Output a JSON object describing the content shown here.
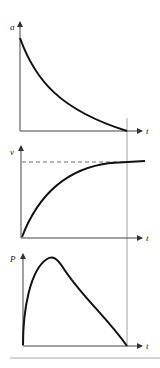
{
  "figure": {
    "panels": [
      {
        "id": "acceleration",
        "ylabel": "a",
        "xlabel": "t",
        "curve": "exponential-decay"
      },
      {
        "id": "velocity",
        "ylabel": "v",
        "xlabel": "t",
        "curve": "exponential-approach",
        "asymptote": "dashed"
      },
      {
        "id": "power",
        "ylabel": "P",
        "xlabel": "t",
        "curve": "rise-peak-decline"
      }
    ],
    "colors": {
      "curve": "#111111",
      "axis": "#444444",
      "guide": "#888888",
      "rule": "#aaaaaa"
    }
  }
}
